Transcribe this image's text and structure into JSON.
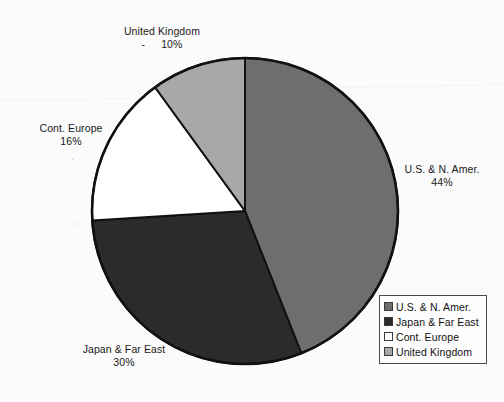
{
  "chart_data": {
    "type": "pie",
    "title": "",
    "categories": [
      "U.S. & N. Amer.",
      "Japan & Far East",
      "Cont. Europe",
      "United Kingdom"
    ],
    "values": [
      44,
      30,
      16,
      10
    ],
    "value_unit": "%",
    "legend_position": "bottom-right",
    "grid": false,
    "start_angle_deg": 0,
    "direction": "clockwise",
    "colors": [
      "#6e6e6e",
      "#2b2b2b",
      "#ffffff",
      "#a8a8a8"
    ],
    "slices": [
      {
        "label": "U.S. & N. Amer.",
        "value": 44,
        "value_text": "44%",
        "color": "#6e6e6e"
      },
      {
        "label": "Japan & Far East",
        "value": 30,
        "value_text": "30%",
        "color": "#2b2b2b"
      },
      {
        "label": "Cont. Europe",
        "value": 16,
        "value_text": "16%",
        "color": "#ffffff"
      },
      {
        "label": "United Kingdom",
        "value": 10,
        "value_text": "10%",
        "color": "#a8a8a8"
      }
    ]
  },
  "labels": {
    "united_kingdom": {
      "name": "United Kingdom",
      "dash": "-",
      "pct": "10%"
    },
    "cont_europe": {
      "name": "Cont. Europe",
      "pct": "16%"
    },
    "us_n_amer": {
      "name": "U.S. & N. Amer.",
      "pct": "44%"
    },
    "japan_far_east": {
      "name": "Japan & Far East",
      "pct": "30%"
    }
  },
  "legend": {
    "items": [
      {
        "label": "U.S. & N. Amer.",
        "color": "#6e6e6e"
      },
      {
        "label": "Japan & Far East",
        "color": "#2b2b2b"
      },
      {
        "label": "Cont. Europe",
        "color": "#ffffff"
      },
      {
        "label": "United Kingdom",
        "color": "#a8a8a8"
      }
    ]
  },
  "style": {
    "background": "#fbfbfb",
    "outline": "#111111",
    "text": "#1a1a1a"
  }
}
